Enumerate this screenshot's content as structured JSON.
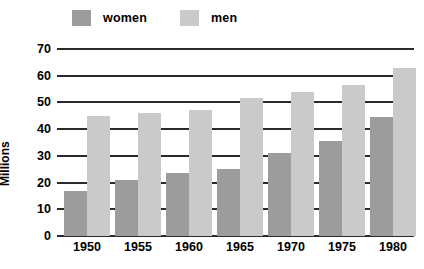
{
  "chart_data": {
    "type": "bar",
    "title": "",
    "subtitle": "",
    "xlabel": "",
    "ylabel": "Millions",
    "categories": [
      "1950",
      "1955",
      "1960",
      "1965",
      "1970",
      "1975",
      "1980"
    ],
    "series": [
      {
        "name": "women",
        "color": "#9c9c9c",
        "values": [
          17,
          21,
          23.5,
          25,
          31,
          35.5,
          44.5
        ]
      },
      {
        "name": "men",
        "color": "#cacaca",
        "values": [
          45,
          46,
          47,
          51.5,
          54,
          56.5,
          63
        ]
      }
    ],
    "ylim": [
      0,
      70
    ],
    "yticks": [
      0,
      10,
      20,
      30,
      40,
      50,
      60,
      70
    ],
    "ytick_labels": [
      "0",
      "10",
      "20",
      "30",
      "40",
      "50",
      "60",
      "70"
    ],
    "grid": true,
    "grid_color": "#2b2b2b",
    "legend_position": "top-left",
    "background": "#ffffff"
  },
  "legend": {
    "items": [
      {
        "label": "women",
        "color": "#9c9c9c"
      },
      {
        "label": "men",
        "color": "#cacaca"
      }
    ]
  }
}
